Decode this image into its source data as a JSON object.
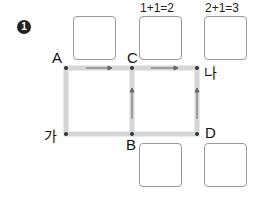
{
  "problem": {
    "number": "1"
  },
  "labels": {
    "A": "A",
    "C": "C",
    "na": "나",
    "ga": "가",
    "B": "B",
    "D": "D"
  },
  "equations": [
    "1+1=2",
    "2+1=3"
  ],
  "colors": {
    "path": "#d6d6d6",
    "arrow": "#666666",
    "dot": "#333333",
    "box_border": "#999999"
  }
}
